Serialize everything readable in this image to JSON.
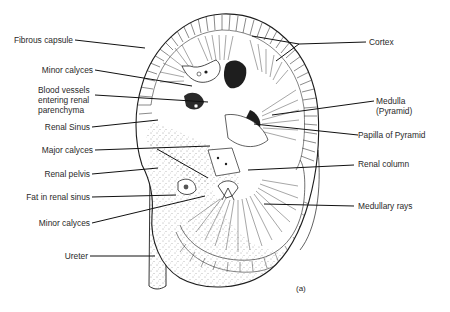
{
  "figure": {
    "caption": "(a)",
    "colors": {
      "ink": "#1e1e1e",
      "background": "#ffffff"
    }
  },
  "labels": {
    "left": [
      {
        "id": "fibrous-capsule",
        "text": "Fibrous capsule"
      },
      {
        "id": "minor-calyces-upper",
        "text": "Minor calyces"
      },
      {
        "id": "blood-vessels",
        "lines": [
          "Blood vessels",
          "entering renal",
          "parenchyma"
        ]
      },
      {
        "id": "renal-sinus",
        "text": "Renal Sinus"
      },
      {
        "id": "major-calyces",
        "text": "Major calyces"
      },
      {
        "id": "renal-pelvis",
        "text": "Renal pelvis"
      },
      {
        "id": "fat-in-renal-sinus",
        "text": "Fat in renal sinus"
      },
      {
        "id": "minor-calyces-lower",
        "text": "Minor calyces"
      },
      {
        "id": "ureter",
        "text": "Ureter"
      }
    ],
    "right": [
      {
        "id": "cortex",
        "text": "Cortex"
      },
      {
        "id": "medulla",
        "lines": [
          "Medulla",
          "(Pyramid)"
        ]
      },
      {
        "id": "papilla-of-pyramid",
        "text": "Papilla of Pyramid"
      },
      {
        "id": "renal-column",
        "text": "Renal column"
      },
      {
        "id": "medullary-rays",
        "text": "Medullary rays"
      }
    ]
  }
}
